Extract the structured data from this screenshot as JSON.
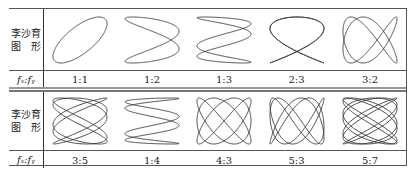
{
  "table": {
    "header_label_line1": "李沙育",
    "header_label_line2": "图　形",
    "ratio_label": "fₓ:fᵧ",
    "rows": [
      {
        "ratios": [
          "1:1",
          "1:2",
          "1:3",
          "2:3",
          "3:2"
        ]
      },
      {
        "ratios": [
          "3:5",
          "1:4",
          "4:3",
          "5:3",
          "5:7"
        ]
      }
    ],
    "figure_params": [
      [
        [
          1,
          1
        ],
        [
          1,
          2
        ],
        [
          1,
          3
        ],
        [
          2,
          3
        ],
        [
          3,
          2
        ]
      ],
      [
        [
          3,
          5
        ],
        [
          1,
          4
        ],
        [
          4,
          3
        ],
        [
          5,
          3
        ],
        [
          5,
          7
        ]
      ]
    ]
  }
}
